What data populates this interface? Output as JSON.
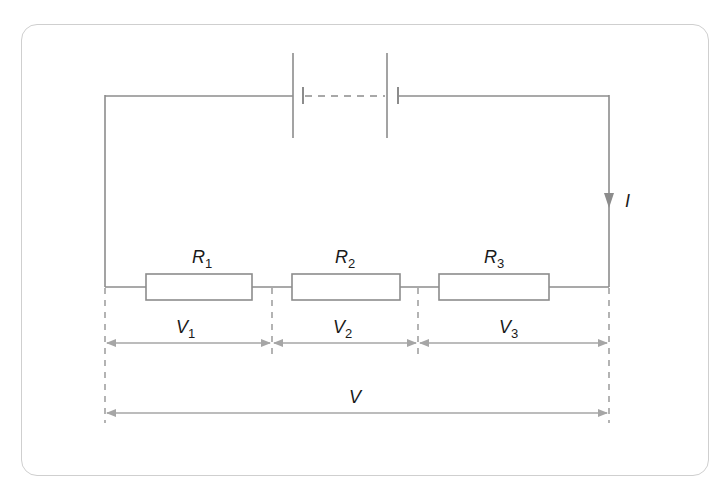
{
  "diagram": {
    "colors": {
      "wire": "#8c8c8c",
      "text": "#1a1a1a",
      "frame": "#cfcfcf",
      "arrow": "#a6a6a6"
    },
    "current_label": "I",
    "total_voltage_label": "V",
    "resistors": [
      {
        "label": "R",
        "subscript": "1"
      },
      {
        "label": "R",
        "subscript": "2"
      },
      {
        "label": "R",
        "subscript": "3"
      }
    ],
    "voltages": [
      {
        "label": "V",
        "subscript": "1"
      },
      {
        "label": "V",
        "subscript": "2"
      },
      {
        "label": "V",
        "subscript": "3"
      }
    ]
  }
}
